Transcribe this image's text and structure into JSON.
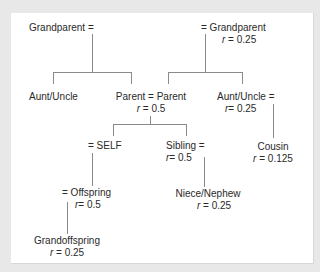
{
  "diagram": {
    "title": "",
    "colors": {
      "background": "#e8e8e8",
      "panel": "#ffffff",
      "text": "#2a2a2a",
      "lines": "#8a8a8a"
    },
    "nodes": {
      "grandparent_left": {
        "name": "Grandparent =",
        "r": ""
      },
      "grandparent_right": {
        "name": "= Grandparent",
        "r_symbol": "r",
        "r": " = 0.25"
      },
      "aunt_uncle_left": {
        "name": "Aunt/Uncle",
        "r": ""
      },
      "parent": {
        "name": "Parent = Parent",
        "r_symbol": "r",
        "r": " = 0.5"
      },
      "aunt_uncle_right": {
        "name": "Aunt/Uncle =",
        "r_symbol": "r",
        "r": "= 0.25"
      },
      "self": {
        "name": "= SELF",
        "r": ""
      },
      "sibling": {
        "name": "Sibling =",
        "r_symbol": "r",
        "r": "= 0.5"
      },
      "cousin": {
        "name": "Cousin",
        "r_symbol": "r",
        "r": " = 0.125"
      },
      "offspring": {
        "name": "= Offspring",
        "r_symbol": "r",
        "r": "= 0.5"
      },
      "niece_nephew": {
        "name": "Niece/Nephew",
        "r_symbol": "r",
        "r": " = 0.25"
      },
      "grandoffspring": {
        "name": "Grandoffspring",
        "r_symbol": "r",
        "r": " = 0.25"
      }
    },
    "edges": [
      {
        "from": "grandparent_left",
        "to": "aunt_uncle_left"
      },
      {
        "from": "grandparent_left",
        "to": "parent"
      },
      {
        "from": "grandparent_right",
        "to": "parent"
      },
      {
        "from": "grandparent_right",
        "to": "aunt_uncle_right"
      },
      {
        "from": "parent",
        "to": "self"
      },
      {
        "from": "parent",
        "to": "sibling"
      },
      {
        "from": "aunt_uncle_right",
        "to": "cousin"
      },
      {
        "from": "self",
        "to": "offspring"
      },
      {
        "from": "sibling",
        "to": "niece_nephew"
      },
      {
        "from": "offspring",
        "to": "grandoffspring"
      }
    ]
  }
}
